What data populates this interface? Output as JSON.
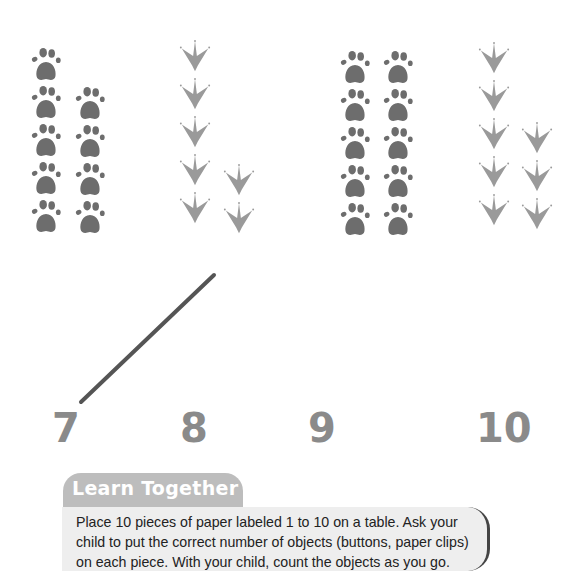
{
  "groups": [
    {
      "number": "7",
      "icon": "paw-print-icon",
      "columns": [
        5,
        2
      ],
      "color": "#6d6d6d"
    },
    {
      "number": "8",
      "icon": "bird-track-icon",
      "columns": [
        5,
        2
      ],
      "color": "#9a9a9a"
    },
    {
      "number": "9",
      "icon": "paw-print-icon",
      "columns": [
        5,
        5
      ],
      "color": "#6d6d6d"
    },
    {
      "number": "10",
      "icon": "bird-track-icon",
      "columns": [
        5,
        3
      ],
      "color": "#9a9a9a"
    }
  ],
  "numbers": {
    "n7": "7",
    "n8": "8",
    "n9": "9",
    "n10": "10"
  },
  "matching_line": {
    "x1": 81,
    "y1": 402,
    "x2": 214,
    "y2": 275,
    "color": "#555555"
  },
  "learn_together": {
    "title": "Learn Together",
    "body": "Place 10 pieces of paper labeled 1 to 10 on a table. Ask your child to put the correct number of objects (buttons, paper clips) on each piece. With your child, count the objects as you go."
  }
}
